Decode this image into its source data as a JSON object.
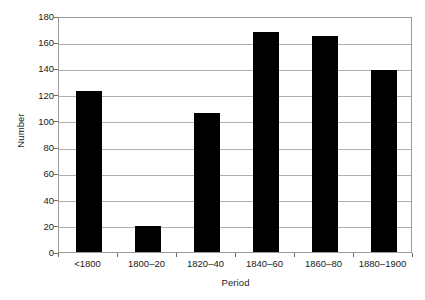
{
  "chart_data": {
    "type": "bar",
    "title": "",
    "subtitle": "",
    "categories": [
      "<1800",
      "1800–20",
      "1820–40",
      "1840–60",
      "1860–80",
      "1880–1900"
    ],
    "values": [
      123,
      20,
      106,
      168,
      165,
      139
    ],
    "xlabel": "Period",
    "ylabel": "Number",
    "ylim": [
      0,
      180
    ],
    "ytick_values": [
      0,
      20,
      40,
      60,
      80,
      100,
      120,
      140,
      160,
      180
    ],
    "ytick_labels": [
      "0",
      "20",
      "40",
      "60",
      "80",
      "100",
      "120",
      "140",
      "160",
      "180"
    ],
    "grid": "horizontal",
    "legend": "none",
    "bar_color": "#000000",
    "grid_color": "#b0b0b0",
    "frame_color": "#9a9a9a",
    "background_color": "#ffffff",
    "annotations": []
  }
}
